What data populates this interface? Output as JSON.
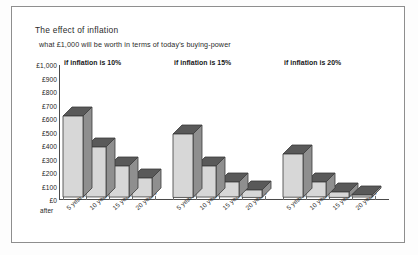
{
  "chart": {
    "title": "The effect of inflation",
    "subtitle": "what £1,000 will be worth in terms of today's buying-power",
    "after_label": "after"
  },
  "chart_data": {
    "type": "bar",
    "title": "The effect of inflation",
    "subtitle": "what £1,000 will be worth in terms of today's buying-power",
    "xlabel": "",
    "ylabel": "",
    "ylim": [
      0,
      1000
    ],
    "ytick_labels": [
      "£1,000",
      "£900",
      "£800",
      "£700",
      "£600",
      "£500",
      "£400",
      "£300",
      "£200",
      "£100",
      "£0"
    ],
    "ytick_values": [
      1000,
      900,
      800,
      700,
      600,
      500,
      400,
      300,
      200,
      100,
      0
    ],
    "categories": [
      "5 years",
      "10 years",
      "15 years",
      "20 years"
    ],
    "grid": false,
    "legend": "none",
    "style_3d": true,
    "groups": [
      {
        "name": "if inflation is 10%",
        "values": [
          600,
          370,
          230,
          140
        ]
      },
      {
        "name": "if inflation is 15%",
        "values": [
          470,
          230,
          110,
          55
        ]
      },
      {
        "name": "if inflation is 20%",
        "values": [
          320,
          110,
          40,
          15
        ]
      }
    ]
  },
  "colors": {
    "bar_front": "#d7d7d7",
    "bar_top": "#595959",
    "bar_side": "#8f8f8f",
    "outline": "#3a3a3a",
    "axis": "#4a4a4a",
    "frame": "#8e8e8e",
    "text": "#1c1c1c",
    "background": "#ffffff"
  }
}
